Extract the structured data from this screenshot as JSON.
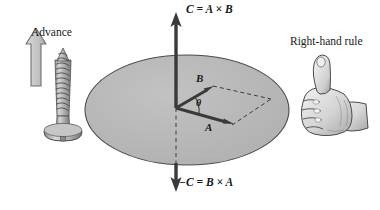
{
  "figure": {
    "title": "Cross product right-hand rule diagram",
    "background_color": "#ffffff"
  },
  "labels": {
    "advance": "Advance",
    "right_hand_rule": "Right-hand rule",
    "c_positive": "C = A × B",
    "c_negative": "−C = B × A",
    "vector_a": "A",
    "vector_b": "B",
    "angle_theta": "θ"
  },
  "icons": {
    "advance_arrow": "up-arrow-icon",
    "screw": "screw-icon",
    "hand": "thumbs-up-hand-icon",
    "axis_arrow_up": "axis-arrow-up-icon",
    "axis_arrow_down": "axis-arrow-down-icon",
    "vector_a_arrow": "vector-a-arrow-icon",
    "vector_b_arrow": "vector-b-arrow-icon"
  },
  "colors": {
    "plane_fill": "#b8b8b8",
    "plane_stroke": "#4a4a4a",
    "vector_stroke": "#3a3a3a",
    "dashed_stroke": "#3a3a3a",
    "advance_arrow_fill": "#c9c9c9",
    "advance_arrow_stroke": "#6b6b6b",
    "screw_fill": "#b4b4b4",
    "screw_stroke": "#4f4f4f",
    "hand_fill": "#e8e8e8",
    "hand_stroke": "#4a4a4a",
    "text": "#191919"
  },
  "geometry": {
    "plane_center_x": 187,
    "plane_center_y": 110,
    "plane_radius_x": 102,
    "plane_radius_y": 55,
    "origin_x": 176,
    "origin_y": 108,
    "axis_top_y": 14,
    "axis_bottom_y": 190,
    "vector_a_tip_x": 226,
    "vector_a_tip_y": 123,
    "vector_b_tip_x": 211,
    "vector_b_tip_y": 88,
    "parallelogram_far_x": 271,
    "parallelogram_far_y": 99
  }
}
